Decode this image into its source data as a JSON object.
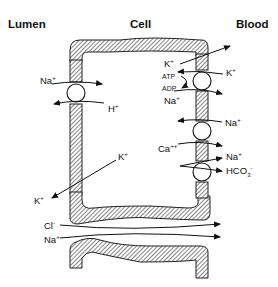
{
  "headers": {
    "lumen": "Lumen",
    "cell": "Cell",
    "blood": "Blood"
  },
  "apical_exchanger": {
    "ion_in": "Na",
    "ion_in_charge": "+",
    "ion_out": "H",
    "ion_out_charge": "+"
  },
  "basolateral": {
    "k_channel_top": {
      "ion": "K",
      "charge": "+"
    },
    "na_k_pump": {
      "k_ion": "K",
      "k_charge": "+",
      "atp": "ATP",
      "adp": "ADP",
      "na_ion": "Na",
      "na_charge": "+"
    },
    "na_ca_exchanger": {
      "na_ion": "Na",
      "na_charge": "+",
      "ca_ion": "Ca",
      "ca_charge": "++"
    },
    "na_hco3_cotransporter": {
      "na_ion": "Na",
      "na_charge": "+",
      "hco3_ion": "HCO",
      "hco3_sub": "3",
      "hco3_charge": "-"
    }
  },
  "apical_k": {
    "ion_inside": "K",
    "inside_charge": "+",
    "ion_lumen": "K",
    "lumen_charge": "+"
  },
  "paracellular": {
    "cl_ion": "Cl",
    "cl_charge": "-",
    "na_ion": "Na",
    "na_charge": "+"
  },
  "colors": {
    "line": "#111111",
    "background": "#ffffff"
  }
}
